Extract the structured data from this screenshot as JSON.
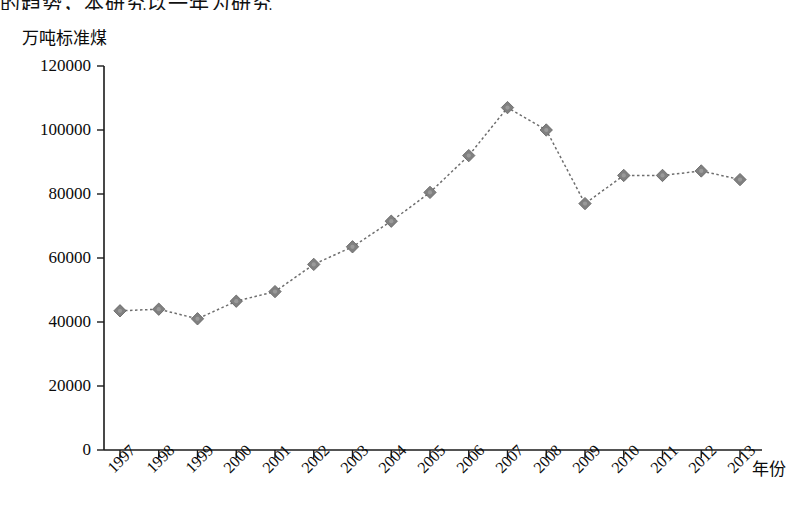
{
  "page": {
    "cropped_top_text": "的趋势，本研究以一年为研究"
  },
  "chart_data": {
    "type": "line",
    "title": "",
    "subtitle": "",
    "xlabel": "年份",
    "ylabel": "万吨标准煤",
    "categories": [
      "1997",
      "1998",
      "1999",
      "2000",
      "2001",
      "2002",
      "2003",
      "2004",
      "2005",
      "2006",
      "2007",
      "2008",
      "2009",
      "2010",
      "2011",
      "2012",
      "2013"
    ],
    "values": [
      43500,
      44000,
      41000,
      46500,
      49500,
      58000,
      63500,
      71500,
      80500,
      92000,
      107000,
      100000,
      77000,
      85800,
      85800,
      87200,
      84500
    ],
    "series": [
      {
        "name": "万吨标准煤",
        "values": [
          43500,
          44000,
          41000,
          46500,
          49500,
          58000,
          63500,
          71500,
          80500,
          92000,
          107000,
          100000,
          77000,
          85800,
          85800,
          87200,
          84500
        ]
      }
    ],
    "ylim": [
      0,
      120000
    ],
    "ytick_labels": [
      "0",
      "20000",
      "40000",
      "60000",
      "80000",
      "100000",
      "120000"
    ],
    "ytick_values": [
      0,
      20000,
      40000,
      60000,
      80000,
      100000,
      120000
    ],
    "grid": false,
    "legend": false,
    "legend_position": "none",
    "marker": "diamond",
    "line_style": "dotted",
    "colors": {
      "axis": "#1a1a1a",
      "line": "#6e6e6e",
      "marker": "#808080",
      "text": "#0b0b0b",
      "background": "#ffffff"
    }
  }
}
